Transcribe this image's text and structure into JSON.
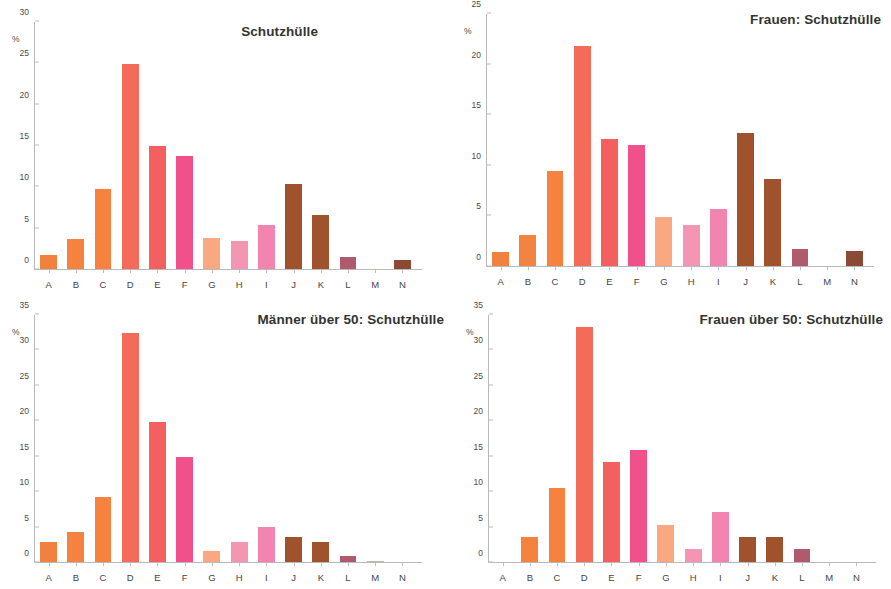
{
  "figure": {
    "categories": [
      "A",
      "B",
      "C",
      "D",
      "E",
      "F",
      "G",
      "H",
      "I",
      "J",
      "K",
      "L",
      "M",
      "N"
    ],
    "axis_unit_label": "%",
    "bar_colors": [
      "#f2803e",
      "#f4833f",
      "#f5833f",
      "#f56b5a",
      "#f4605f",
      "#f0518a",
      "#f9a882",
      "#f595b4",
      "#f285b0",
      "#a0522d",
      "#a0522d",
      "#b05a6e",
      "#c9b8a8",
      "#8b4a35"
    ]
  },
  "chart_data": [
    {
      "id": "gesamt",
      "type": "bar",
      "title": "Schutzhülle",
      "xlabel": "",
      "ylabel": "%",
      "ylim": [
        0,
        30
      ],
      "yticks": [
        0,
        5,
        10,
        15,
        20,
        25,
        30
      ],
      "grid": false,
      "legend": "none",
      "categories": [
        "A",
        "B",
        "C",
        "D",
        "E",
        "F",
        "G",
        "H",
        "I",
        "J",
        "K",
        "L",
        "M",
        "N"
      ],
      "values": [
        1.7,
        3.6,
        9.7,
        24.9,
        15.0,
        13.7,
        3.8,
        3.4,
        5.3,
        10.3,
        6.5,
        1.4,
        0.05,
        1.1
      ]
    },
    {
      "id": "frauen",
      "type": "bar",
      "title": "Frauen: Schutzhülle",
      "xlabel": "",
      "ylabel": "%",
      "ylim": [
        0,
        25
      ],
      "yticks": [
        0,
        5,
        10,
        15,
        20,
        25
      ],
      "grid": false,
      "legend": "none",
      "categories": [
        "A",
        "B",
        "C",
        "D",
        "E",
        "F",
        "G",
        "H",
        "I",
        "J",
        "K",
        "L",
        "M",
        "N"
      ],
      "values": [
        1.4,
        3.1,
        9.4,
        21.8,
        12.6,
        12.0,
        4.9,
        4.1,
        5.7,
        13.2,
        8.6,
        1.7,
        0.0,
        1.5
      ]
    },
    {
      "id": "maenner-ueber-50",
      "type": "bar",
      "title": "Männer über 50: Schutzhülle",
      "xlabel": "",
      "ylabel": "%",
      "ylim": [
        0,
        35
      ],
      "yticks": [
        0,
        5,
        10,
        15,
        20,
        25,
        30,
        35
      ],
      "grid": false,
      "legend": "none",
      "categories": [
        "A",
        "B",
        "C",
        "D",
        "E",
        "F",
        "G",
        "H",
        "I",
        "J",
        "K",
        "L",
        "M",
        "N"
      ],
      "values": [
        2.9,
        4.3,
        9.2,
        32.4,
        19.8,
        14.9,
        1.5,
        2.9,
        5.0,
        3.6,
        2.9,
        0.8,
        0.1,
        0.0
      ]
    },
    {
      "id": "frauen-ueber-50",
      "type": "bar",
      "title": "Frauen über 50: Schutzhülle",
      "xlabel": "",
      "ylabel": "%",
      "ylim": [
        0,
        35
      ],
      "yticks": [
        0,
        5,
        10,
        15,
        20,
        25,
        30,
        35
      ],
      "grid": false,
      "legend": "none",
      "categories": [
        "A",
        "B",
        "C",
        "D",
        "E",
        "F",
        "G",
        "H",
        "I",
        "J",
        "K",
        "L",
        "M",
        "N"
      ],
      "values": [
        0.0,
        3.5,
        10.5,
        33.3,
        14.2,
        15.9,
        5.3,
        1.8,
        7.1,
        3.6,
        3.6,
        1.8,
        0.0,
        0.0
      ]
    }
  ]
}
